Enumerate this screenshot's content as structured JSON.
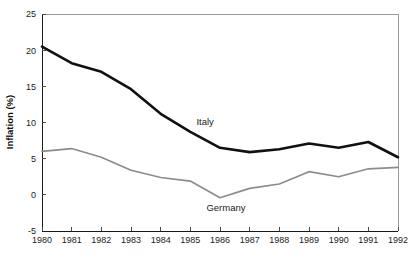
{
  "chart_data": {
    "type": "line",
    "title": "",
    "xlabel": "",
    "ylabel": "Inflation (%)",
    "x": [
      1980,
      1981,
      1982,
      1983,
      1984,
      1985,
      1986,
      1987,
      1988,
      1989,
      1990,
      1991,
      1992
    ],
    "categories": [
      "1980",
      "1981",
      "1982",
      "1983",
      "1984",
      "1985",
      "1986",
      "1987",
      "1988",
      "1989",
      "1990",
      "1991",
      "1992"
    ],
    "xlim": [
      1980,
      1992
    ],
    "ylim": [
      -5,
      25
    ],
    "yticks": [
      -5,
      0,
      5,
      10,
      15,
      20,
      25
    ],
    "ytick_labels": [
      "-5",
      "0",
      "5",
      "10",
      "15",
      "20",
      "25"
    ],
    "grid": false,
    "legend_position": "inline-annotations",
    "series": [
      {
        "name": "Italy",
        "color": "#111111",
        "line_width": 2.6,
        "values": [
          20.5,
          18.2,
          17.0,
          14.6,
          11.2,
          8.7,
          6.5,
          5.9,
          6.3,
          7.1,
          6.5,
          7.3,
          5.2
        ]
      },
      {
        "name": "Germany",
        "color": "#8c8c8c",
        "line_width": 1.7,
        "values": [
          6.0,
          6.4,
          5.2,
          3.4,
          2.4,
          1.9,
          -0.4,
          0.9,
          1.5,
          3.2,
          2.5,
          3.6,
          3.8
        ]
      }
    ],
    "annotations": [
      {
        "text": "Italy",
        "x": 1985.5,
        "y": 9.6
      },
      {
        "text": "Germany",
        "x": 1986.2,
        "y": -2.3
      }
    ]
  },
  "colors": {
    "background": "#ffffff",
    "axis": "#1a1a1a",
    "frame": "#9a9a9a",
    "italy": "#111111",
    "germany": "#8c8c8c"
  }
}
